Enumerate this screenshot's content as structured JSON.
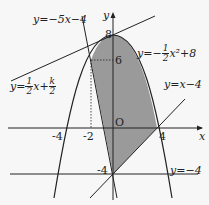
{
  "diagram": {
    "axes": {
      "x_label": "x",
      "y_label": "y",
      "origin_label": "O"
    },
    "ticks": {
      "x": [
        "-4",
        "-2",
        "4"
      ],
      "y": [
        "8",
        "6",
        "-4"
      ]
    },
    "curves": {
      "parabola": {
        "label_prefix": "y=−",
        "frac_num": "1",
        "frac_den": "2",
        "label_suffix": "x²+8"
      },
      "line_steep": {
        "label": "y=−5x−4"
      },
      "line_k": {
        "label_prefix": "y=",
        "frac1_num": "1",
        "frac1_den": "2",
        "mid": "x+",
        "frac2_num": "k",
        "frac2_den": "2"
      },
      "line_diag": {
        "label": "y=x−4"
      },
      "line_horiz": {
        "label": "y=−4"
      }
    },
    "colors": {
      "shade": "#9a9a9a",
      "line": "#222222",
      "background": "#f7f7f7"
    }
  }
}
